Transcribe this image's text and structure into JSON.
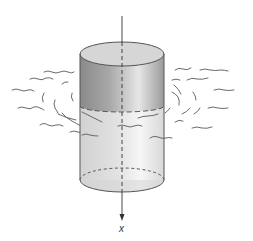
{
  "figure": {
    "axis": {
      "label": "x",
      "direction": "down"
    },
    "colors": {
      "cylinder_top_band": "#8c8c8c",
      "cylinder_top_face": "#d4d4d4",
      "cylinder_body": "#dcdcdc",
      "cylinder_body_highlight": "#f2f2f2",
      "outline": "#555555",
      "fluid_lines": "#555555",
      "axis": "#333333"
    }
  }
}
